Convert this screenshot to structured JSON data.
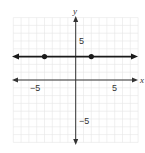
{
  "chart_data": {
    "type": "line",
    "title": "",
    "xlabel": "x",
    "ylabel": "y",
    "xlim": [
      -8,
      8
    ],
    "ylim": [
      -8,
      8
    ],
    "grid": true,
    "x_ticks_labeled": [
      "−5",
      "5"
    ],
    "y_ticks_labeled": [
      "5",
      "−5"
    ],
    "series": [
      {
        "name": "horizontal line y = 3",
        "equation": "y = 3",
        "x": [
          -8,
          8
        ],
        "y": [
          3,
          3
        ],
        "arrows_both_ends": true
      }
    ],
    "points": [
      {
        "x": -4,
        "y": 3
      },
      {
        "x": 2,
        "y": 3
      }
    ]
  },
  "labels": {
    "x_axis": "x",
    "y_axis": "y",
    "x_neg5": "−5",
    "x_pos5": "5",
    "y_pos5": "5",
    "y_neg5": "−5"
  },
  "colors": {
    "grid": "#e6e6e6",
    "axis": "#333333",
    "line": "#1a1a1a"
  }
}
